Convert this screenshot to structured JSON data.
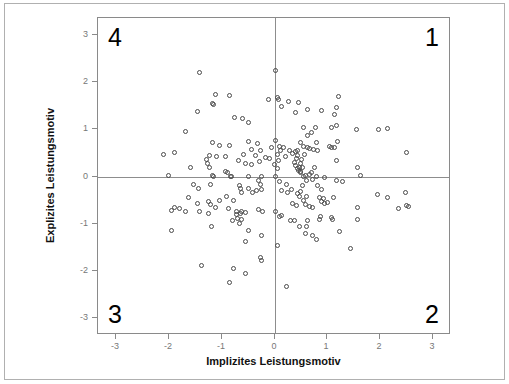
{
  "chart_data": {
    "type": "scatter",
    "title": "",
    "xlabel": "Implizites Leistungsmotiv",
    "ylabel": "Explizites Leistungsmotiv",
    "xlim": [
      -3.35,
      3.35
    ],
    "ylim": [
      -3.35,
      3.35
    ],
    "xticks": [
      -3,
      -2,
      -1,
      0,
      1,
      2,
      3
    ],
    "yticks": [
      -3,
      -2,
      -1,
      0,
      1,
      2,
      3
    ],
    "xticklabels": [
      "-3",
      "-2",
      "-1",
      "0",
      "1",
      "2",
      "3"
    ],
    "yticklabels": [
      "-3",
      "-2",
      "-1",
      "0",
      "1",
      "2",
      "3"
    ],
    "grid": false,
    "legend": null,
    "reference_lines": {
      "vertical_at_x": 0,
      "horizontal_at_y": 0,
      "color": "#8d8d8d"
    },
    "marker": {
      "shape": "open-circle",
      "size_px": 5,
      "edge_color": "#4a4a4a",
      "fill": "none"
    },
    "annotations": [
      {
        "text": "1",
        "quadrant": "upper-right",
        "x": 3.0,
        "y": 3.0
      },
      {
        "text": "2",
        "quadrant": "lower-right",
        "x": 3.0,
        "y": -3.0
      },
      {
        "text": "3",
        "quadrant": "lower-left",
        "x": -3.0,
        "y": -3.0
      },
      {
        "text": "4",
        "quadrant": "upper-left",
        "x": -3.0,
        "y": 3.0
      }
    ],
    "n_points": 214,
    "points": [
      [
        -1.42,
        2.19
      ],
      [
        0.01,
        2.23
      ],
      [
        -1.12,
        1.74
      ],
      [
        -0.85,
        1.71
      ],
      [
        1.22,
        1.7
      ],
      [
        0.06,
        1.67
      ],
      [
        -0.12,
        1.63
      ],
      [
        0.08,
        1.62
      ],
      [
        -1.18,
        1.55
      ],
      [
        -1.15,
        1.53
      ],
      [
        0.26,
        1.58
      ],
      [
        0.46,
        1.57
      ],
      [
        0.14,
        1.49
      ],
      [
        -1.47,
        1.38
      ],
      [
        0.63,
        1.41
      ],
      [
        0.9,
        1.4
      ],
      [
        1.17,
        1.45
      ],
      [
        1.13,
        1.32
      ],
      [
        0.39,
        1.35
      ],
      [
        -0.75,
        1.25
      ],
      [
        -0.61,
        1.22
      ],
      [
        -0.49,
        1.15
      ],
      [
        1.17,
        1.08
      ],
      [
        1.09,
        1.03
      ],
      [
        0.55,
        1.04
      ],
      [
        0.77,
        1.03
      ],
      [
        1.55,
        1.0
      ],
      [
        1.98,
        1.0
      ],
      [
        2.15,
        1.02
      ],
      [
        -1.69,
        0.95
      ],
      [
        0.7,
        0.93
      ],
      [
        0.63,
        0.86
      ],
      [
        -1.17,
        0.72
      ],
      [
        -0.49,
        0.74
      ],
      [
        -0.33,
        0.7
      ],
      [
        0.02,
        0.76
      ],
      [
        0.49,
        0.72
      ],
      [
        0.8,
        0.72
      ],
      [
        1.2,
        0.75
      ],
      [
        -1.05,
        0.66
      ],
      [
        -0.85,
        0.65
      ],
      [
        0.09,
        0.64
      ],
      [
        0.18,
        0.62
      ],
      [
        0.55,
        0.63
      ],
      [
        0.62,
        0.62
      ],
      [
        0.66,
        0.6
      ],
      [
        1.04,
        0.64
      ],
      [
        1.08,
        0.62
      ],
      [
        1.13,
        0.61
      ],
      [
        -0.43,
        0.58
      ],
      [
        -0.26,
        0.55
      ],
      [
        0.11,
        0.56
      ],
      [
        0.29,
        0.55
      ],
      [
        0.44,
        0.56
      ],
      [
        0.74,
        0.57
      ],
      [
        0.82,
        0.56
      ],
      [
        -2.1,
        0.47
      ],
      [
        -1.9,
        0.5
      ],
      [
        -1.24,
        0.45
      ],
      [
        -1.1,
        0.43
      ],
      [
        -0.93,
        0.42
      ],
      [
        -0.58,
        0.46
      ],
      [
        -0.36,
        0.45
      ],
      [
        0.05,
        0.47
      ],
      [
        0.57,
        0.47
      ],
      [
        2.5,
        0.5
      ],
      [
        -1.3,
        0.36
      ],
      [
        -0.69,
        0.33
      ],
      [
        -0.29,
        0.32
      ],
      [
        0.08,
        0.33
      ],
      [
        0.51,
        0.35
      ],
      [
        1.17,
        0.34
      ],
      [
        -1.28,
        0.27
      ],
      [
        -0.55,
        0.27
      ],
      [
        -0.44,
        0.26
      ],
      [
        0.0,
        0.25
      ],
      [
        0.49,
        0.27
      ],
      [
        -1.6,
        0.18
      ],
      [
        -1.23,
        0.18
      ],
      [
        0.05,
        0.17
      ],
      [
        0.48,
        0.19
      ],
      [
        0.53,
        0.18
      ],
      [
        0.75,
        0.19
      ],
      [
        1.58,
        0.2
      ],
      [
        -0.93,
        0.1
      ],
      [
        -0.9,
        0.09
      ],
      [
        0.46,
        0.12
      ],
      [
        0.5,
        0.11
      ],
      [
        -2.02,
        0.03
      ],
      [
        -1.18,
        0.02
      ],
      [
        -1.15,
        0.0
      ],
      [
        -0.84,
        0.0
      ],
      [
        -0.82,
        -0.01
      ],
      [
        -0.5,
        0.0
      ],
      [
        -0.24,
        0.0
      ],
      [
        0.02,
        -0.01
      ],
      [
        0.55,
        0.0
      ],
      [
        0.79,
        0.0
      ],
      [
        0.95,
        -0.02
      ],
      [
        1.63,
        0.02
      ],
      [
        -0.3,
        -0.09
      ],
      [
        0.09,
        -0.1
      ],
      [
        0.6,
        -0.08
      ],
      [
        0.73,
        -0.07
      ],
      [
        1.18,
        -0.08
      ],
      [
        1.3,
        -0.1
      ],
      [
        -1.53,
        -0.17
      ],
      [
        -1.22,
        -0.16
      ],
      [
        -0.66,
        -0.18
      ],
      [
        -0.27,
        -0.17
      ],
      [
        0.22,
        -0.16
      ],
      [
        0.54,
        -0.18
      ],
      [
        0.82,
        -0.2
      ],
      [
        -1.45,
        -0.26
      ],
      [
        -0.65,
        -0.25
      ],
      [
        -0.5,
        -0.26
      ],
      [
        -0.34,
        -0.3
      ],
      [
        -0.25,
        -0.27
      ],
      [
        0.13,
        -0.29
      ],
      [
        0.33,
        -0.28
      ],
      [
        0.49,
        -0.32
      ],
      [
        0.9,
        -0.27
      ],
      [
        -0.62,
        -0.33
      ],
      [
        -0.41,
        -0.33
      ],
      [
        0.24,
        -0.34
      ],
      [
        0.44,
        -0.36
      ],
      [
        1.96,
        -0.37
      ],
      [
        2.48,
        -0.34
      ],
      [
        -1.64,
        -0.44
      ],
      [
        -0.91,
        -0.43
      ],
      [
        0.48,
        -0.43
      ],
      [
        0.6,
        -0.42
      ],
      [
        0.86,
        -0.45
      ],
      [
        0.93,
        -0.46
      ],
      [
        1.12,
        -0.44
      ],
      [
        2.15,
        -0.45
      ],
      [
        -1.26,
        -0.52
      ],
      [
        -1.05,
        -0.5
      ],
      [
        -0.78,
        -0.51
      ],
      [
        0.55,
        -0.5
      ],
      [
        0.9,
        -0.53
      ],
      [
        1.0,
        -0.55
      ],
      [
        -1.46,
        -0.58
      ],
      [
        -1.21,
        -0.6
      ],
      [
        0.95,
        -0.57
      ],
      [
        1.58,
        -0.65
      ],
      [
        2.5,
        -0.62
      ],
      [
        2.55,
        -0.63
      ],
      [
        -1.9,
        -0.65
      ],
      [
        -1.81,
        -0.67
      ],
      [
        -1.12,
        -0.65
      ],
      [
        -0.88,
        -0.68
      ],
      [
        -0.3,
        -0.7
      ],
      [
        2.35,
        -0.68
      ],
      [
        -1.96,
        -0.72
      ],
      [
        -1.68,
        -0.73
      ],
      [
        -1.42,
        -0.75
      ],
      [
        -0.73,
        -0.73
      ],
      [
        -0.63,
        -0.74
      ],
      [
        -0.55,
        -0.76
      ],
      [
        -0.23,
        -0.75
      ],
      [
        0.01,
        -0.75
      ],
      [
        -1.25,
        -0.79
      ],
      [
        -0.72,
        -0.8
      ],
      [
        -0.64,
        -0.79
      ],
      [
        0.1,
        -0.84
      ],
      [
        0.13,
        -0.82
      ],
      [
        0.88,
        -0.84
      ],
      [
        1.08,
        -0.86
      ],
      [
        -0.79,
        -0.92
      ],
      [
        0.62,
        -0.93
      ],
      [
        0.85,
        -0.91
      ],
      [
        1.1,
        -0.9
      ],
      [
        1.57,
        -0.9
      ],
      [
        -1.2,
        -1.05
      ],
      [
        -0.66,
        -1.0
      ],
      [
        0.47,
        -1.05
      ],
      [
        0.6,
        -1.06
      ],
      [
        1.23,
        -1.17
      ],
      [
        -1.95,
        -1.14
      ],
      [
        -0.5,
        -1.15
      ],
      [
        0.58,
        -1.2
      ],
      [
        0.72,
        -1.25
      ],
      [
        0.8,
        -1.33
      ],
      [
        -0.25,
        -1.24
      ],
      [
        -0.55,
        -1.38
      ],
      [
        0.05,
        -1.46
      ],
      [
        1.45,
        -1.52
      ],
      [
        -0.27,
        -1.72
      ],
      [
        -0.25,
        -1.77
      ],
      [
        -1.38,
        -1.88
      ],
      [
        -0.78,
        -1.95
      ],
      [
        -0.55,
        -2.04
      ],
      [
        -0.85,
        -2.23
      ],
      [
        0.22,
        -2.33
      ],
      [
        0.4,
        0.52
      ],
      [
        0.43,
        0.44
      ],
      [
        0.41,
        0.37
      ],
      [
        0.38,
        0.3
      ],
      [
        0.4,
        0.24
      ],
      [
        0.44,
        0.17
      ],
      [
        0.5,
        0.08
      ],
      [
        0.58,
        0.03
      ],
      [
        0.67,
        0.04
      ],
      [
        0.7,
        0.09
      ],
      [
        0.58,
        -0.6
      ],
      [
        0.66,
        -0.63
      ],
      [
        0.72,
        -0.66
      ],
      [
        0.41,
        -0.62
      ],
      [
        0.35,
        -0.58
      ],
      [
        -0.7,
        -0.88
      ],
      [
        -0.62,
        -0.9
      ],
      [
        0.3,
        -0.92
      ],
      [
        0.38,
        -0.93
      ],
      [
        -0.18,
        0.4
      ],
      [
        -0.1,
        0.37
      ],
      [
        0.2,
        0.42
      ],
      [
        0.34,
        0.48
      ],
      [
        -0.05,
        0.62
      ]
    ]
  }
}
